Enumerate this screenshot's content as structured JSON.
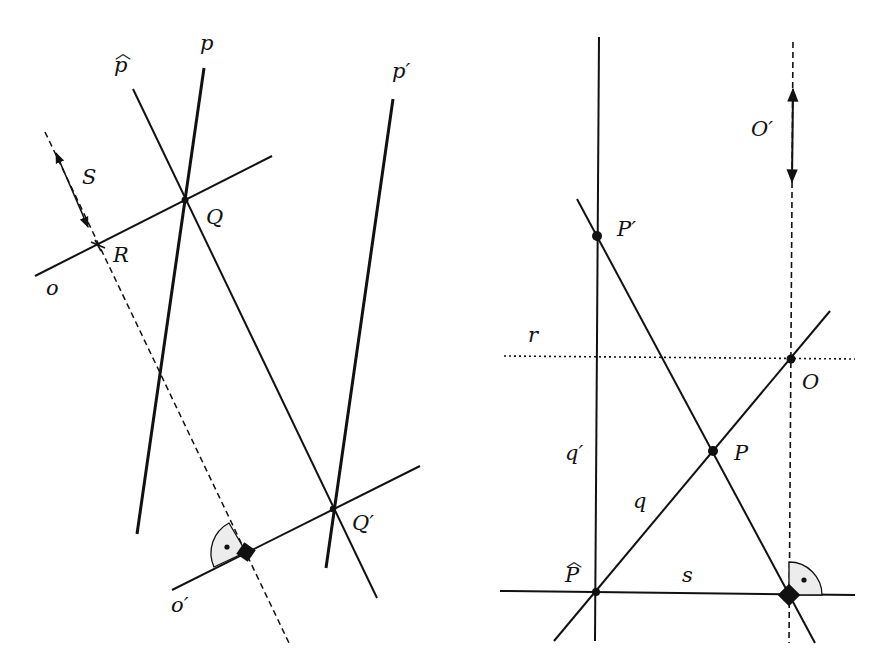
{
  "figure_left": {
    "labels": {
      "p": "p",
      "p_hat": "p",
      "p_prime": "p′",
      "S": "S",
      "Q": "Q",
      "R": "R",
      "o": "o",
      "o_prime": "o′",
      "Q_prime": "Q′"
    }
  },
  "figure_right": {
    "labels": {
      "O_prime": "O′",
      "P_prime": "P′",
      "r": "r",
      "O": "O",
      "q_prime": "q′",
      "P": "P",
      "q": "q",
      "P_hat": "P",
      "s": "s"
    }
  },
  "colors": {
    "ink": "#111111",
    "right_angle_fill": "#ececec",
    "background": "#ffffff"
  }
}
